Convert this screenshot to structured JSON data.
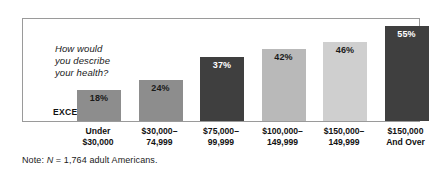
{
  "figure": {
    "question_text": "How would\nyou describe\nyour health?",
    "row_label": "EXCELLENT",
    "note_prefix": "Note: ",
    "note_italic": "N",
    "note_suffix": " = 1,764 adult Americans."
  },
  "colors": {
    "frame_border": "#9a9a9a",
    "bar_medium": "#8d8d8d",
    "bar_dark": "#3f3f3f",
    "bar_light": "#b9b9b9",
    "bar_lighter": "#cfcfcf",
    "text": "#1a1a1a",
    "value_on_dark": "#ffffff",
    "background": "#ffffff"
  },
  "chart_data": {
    "type": "bar",
    "title": "How would you describe your health?",
    "subtitle": "",
    "xlabel": "",
    "ylabel": "",
    "ylim": [
      0,
      60
    ],
    "grid": false,
    "legend": null,
    "annotations": [
      "EXCELLENT",
      "Note: N = 1,764 adult Americans."
    ],
    "categories": [
      "Under\n$30,000",
      "$30,000–\n74,999",
      "$75,000–\n99,999",
      "$100,000–\n149,999",
      "$150,000–\n149,999",
      "$150,000\nAnd Over"
    ],
    "values": [
      18,
      24,
      37,
      42,
      46,
      55
    ],
    "value_labels": [
      "18%",
      "24%",
      "37%",
      "42%",
      "46%",
      "55%"
    ],
    "bar_colors": [
      "#8d8d8d",
      "#8d8d8d",
      "#3f3f3f",
      "#b9b9b9",
      "#cfcfcf",
      "#3f3f3f"
    ],
    "label_on_dark": [
      false,
      false,
      true,
      false,
      false,
      true
    ]
  }
}
